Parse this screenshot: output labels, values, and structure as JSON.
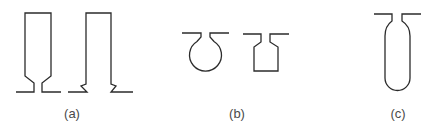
{
  "diagram": {
    "stroke_color": "#2b2b2b",
    "label_color": "#4a4a4a",
    "panels": [
      {
        "id": "a",
        "label": "(a)",
        "shapes": [
          "tall-rectangular-cavity-with-beveled-narrow-neck",
          "tall-rectangular-cavity-with-dovetail-undercut-base"
        ]
      },
      {
        "id": "b",
        "label": "(b)",
        "shapes": [
          "circular-cavity-with-narrow-neck",
          "rectangular-cavity-with-beveled-neck"
        ]
      },
      {
        "id": "c",
        "label": "(c)",
        "shapes": [
          "capsule-cavity-with-narrow-neck"
        ]
      }
    ]
  }
}
